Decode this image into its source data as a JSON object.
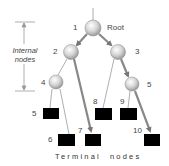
{
  "diagram": {
    "root_label": "Root",
    "internal_label_line1": "Internal",
    "internal_label_line2": "nodes",
    "terminal_label_word1": "Terminal",
    "terminal_label_word2": "nodes",
    "internal_nodes": [
      {
        "id": "1",
        "x": 93,
        "y": 28
      },
      {
        "id": "2",
        "x": 71,
        "y": 52
      },
      {
        "id": "3",
        "x": 118,
        "y": 52
      },
      {
        "id": "4",
        "x": 56,
        "y": 82
      },
      {
        "id": "5",
        "x": 132,
        "y": 84
      }
    ],
    "terminal_nodes": [
      {
        "id": "5",
        "x": 43,
        "y": 108
      },
      {
        "id": "6",
        "x": 58,
        "y": 134
      },
      {
        "id": "7",
        "x": 85,
        "y": 134
      },
      {
        "id": "8",
        "x": 95,
        "y": 108
      },
      {
        "id": "9",
        "x": 120,
        "y": 108
      },
      {
        "id": "10",
        "x": 144,
        "y": 134
      }
    ],
    "labels": {
      "n1": "1",
      "n2": "2",
      "n3": "3",
      "n4": "4",
      "n5": "5",
      "t5": "5",
      "t6": "6",
      "t7": "7",
      "t8": "8",
      "t9": "9",
      "t10": "10"
    },
    "colors": {
      "node_fill": "#d9d9d9",
      "terminal_fill": "#000000",
      "arrow": "#888888",
      "line": "#999999"
    }
  }
}
